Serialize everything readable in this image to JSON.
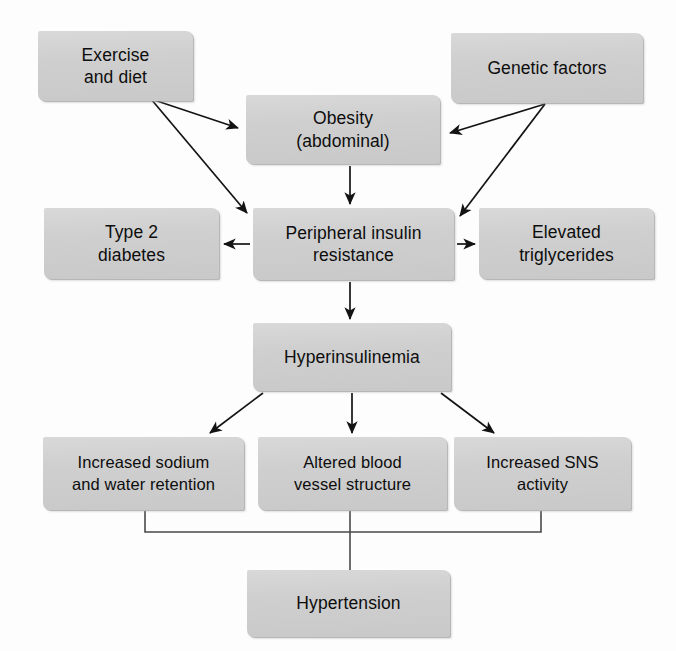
{
  "diagram": {
    "background_color": "#fdfdfd",
    "node_fill_color": "#cecece",
    "node_text_color": "#0d0d0d",
    "edge_color": "#1a1a1a",
    "nodes": [
      {
        "id": "exercise-and-diet",
        "label": "Exercise\nand diet",
        "x": 38,
        "y": 31,
        "w": 155,
        "h": 70
      },
      {
        "id": "genetic-factors",
        "label": "Genetic factors",
        "x": 451,
        "y": 33,
        "w": 192,
        "h": 70
      },
      {
        "id": "obesity-abdominal",
        "label": "Obesity\n(abdominal)",
        "x": 246,
        "y": 95,
        "w": 194,
        "h": 69
      },
      {
        "id": "type-2-diabetes",
        "label": "Type 2\ndiabetes",
        "x": 44,
        "y": 208,
        "w": 175,
        "h": 71
      },
      {
        "id": "peripheral-insulin-resistance",
        "label": "Peripheral insulin\nresistance",
        "x": 253,
        "y": 208,
        "w": 201,
        "h": 72
      },
      {
        "id": "elevated-triglycerides",
        "label": "Elevated\ntriglycerides",
        "x": 479,
        "y": 208,
        "w": 175,
        "h": 71
      },
      {
        "id": "hyperinsulinemia",
        "label": "Hyperinsulinemia",
        "x": 253,
        "y": 323,
        "w": 198,
        "h": 68
      },
      {
        "id": "increased-sodium-water-retention",
        "label": "Increased sodium\nand water retention",
        "x": 43,
        "y": 437,
        "w": 201,
        "h": 73
      },
      {
        "id": "altered-blood-vessel-structure",
        "label": "Altered blood\nvessel structure",
        "x": 258,
        "y": 437,
        "w": 189,
        "h": 73
      },
      {
        "id": "increased-sns-activity",
        "label": "Increased SNS\nactivity",
        "x": 454,
        "y": 437,
        "w": 177,
        "h": 73
      },
      {
        "id": "hypertension",
        "label": "Hypertension",
        "x": 247,
        "y": 570,
        "w": 203,
        "h": 67
      }
    ],
    "edges": [
      {
        "id": "exercise-to-obesity",
        "from": "exercise-and-diet",
        "to": "obesity-abdominal",
        "type": "arrow"
      },
      {
        "id": "exercise-to-insulin-resistance",
        "from": "exercise-and-diet",
        "to": "peripheral-insulin-resistance",
        "type": "arrow"
      },
      {
        "id": "genetic-to-obesity",
        "from": "genetic-factors",
        "to": "obesity-abdominal",
        "type": "arrow"
      },
      {
        "id": "genetic-to-insulin-resistance",
        "from": "genetic-factors",
        "to": "peripheral-insulin-resistance",
        "type": "arrow"
      },
      {
        "id": "obesity-to-insulin-resistance",
        "from": "obesity-abdominal",
        "to": "peripheral-insulin-resistance",
        "type": "arrow"
      },
      {
        "id": "insulin-resistance-to-diabetes",
        "from": "peripheral-insulin-resistance",
        "to": "type-2-diabetes",
        "type": "arrow"
      },
      {
        "id": "insulin-resistance-to-triglycerides",
        "from": "peripheral-insulin-resistance",
        "to": "elevated-triglycerides",
        "type": "arrow"
      },
      {
        "id": "insulin-resistance-to-hyperinsulinemia",
        "from": "peripheral-insulin-resistance",
        "to": "hyperinsulinemia",
        "type": "arrow"
      },
      {
        "id": "hyperinsulinemia-to-sodium",
        "from": "hyperinsulinemia",
        "to": "increased-sodium-water-retention",
        "type": "arrow"
      },
      {
        "id": "hyperinsulinemia-to-vessel",
        "from": "hyperinsulinemia",
        "to": "altered-blood-vessel-structure",
        "type": "arrow"
      },
      {
        "id": "hyperinsulinemia-to-sns",
        "from": "hyperinsulinemia",
        "to": "increased-sns-activity",
        "type": "arrow"
      },
      {
        "id": "sodium-to-hypertension",
        "from": "increased-sodium-water-retention",
        "to": "hypertension",
        "type": "bracket-line"
      },
      {
        "id": "vessel-to-hypertension",
        "from": "altered-blood-vessel-structure",
        "to": "hypertension",
        "type": "bracket-line"
      },
      {
        "id": "sns-to-hypertension",
        "from": "increased-sns-activity",
        "to": "hypertension",
        "type": "bracket-line"
      }
    ]
  }
}
